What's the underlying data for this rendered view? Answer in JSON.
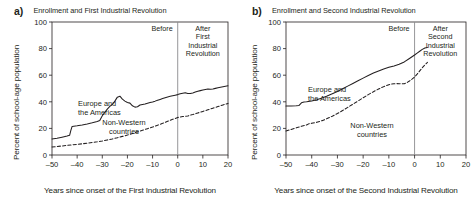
{
  "figure": {
    "background": "#ffffff",
    "ink_color": "#231f20",
    "divider_color": "#8b8b8d"
  },
  "panels": [
    {
      "letter": "a)",
      "title": "Enrollment and First Industrial Revolution",
      "before_label": "Before",
      "after_label": "After First Industrial Revolution",
      "after_label_lines": [
        "After",
        "First",
        "Industrial",
        "Revolution"
      ],
      "series_label_western": "Europe and the Americas",
      "series_label_western_lines": [
        "Europe and",
        "the Americas"
      ],
      "series_label_nonwestern": "Non-Western countries",
      "series_label_nonwestern_lines": [
        "Non-Western",
        "countries"
      ]
    },
    {
      "letter": "b)",
      "title": "Enrollment and Second Industrial Revolution",
      "before_label": "Before",
      "after_label": "After Second Industrial Revolution",
      "after_label_lines": [
        "After",
        "Second",
        "Industrial",
        "Revolution"
      ],
      "series_label_western": "Europe and the Americas",
      "series_label_western_lines": [
        "Europe and",
        "the Americas"
      ],
      "series_label_nonwestern": "Non-Western countries",
      "series_label_nonwestern_lines": [
        "Non-Western",
        "countries"
      ]
    }
  ],
  "chart_data": [
    {
      "type": "line",
      "panel": "a",
      "title": "Enrollment and First Industrial Revolution",
      "xlabel": "Years since onset of the First Industrial Revolution",
      "ylabel": "Percent of school-age population",
      "xlim": [
        -50,
        20
      ],
      "ylim": [
        0,
        100
      ],
      "xticks": [
        -50,
        -40,
        -30,
        -20,
        -10,
        0,
        10,
        20
      ],
      "xticklabels": [
        "–50",
        "–40",
        "–30",
        "–20",
        "–10",
        "0",
        "10",
        "20"
      ],
      "yticks": [
        0,
        20,
        40,
        60,
        80,
        100
      ],
      "yticklabels": [
        "0",
        "20",
        "40",
        "60",
        "80",
        "100"
      ],
      "grid": false,
      "legend": "inline-annotations",
      "vertical_reference_line": {
        "x": 0,
        "label_left": "Before",
        "label_right": "After First Industrial Revolution"
      },
      "series": [
        {
          "name": "Europe and the Americas",
          "style": "solid",
          "x": [
            -50,
            -48,
            -46,
            -44,
            -43,
            -42.5,
            -42,
            -40,
            -38,
            -36,
            -34,
            -32,
            -31,
            -30,
            -29,
            -28,
            -27,
            -26,
            -25,
            -24,
            -23,
            -22,
            -21,
            -20,
            -19,
            -18,
            -17,
            -16,
            -15,
            -14,
            -13,
            -12,
            -11,
            -10,
            -9,
            -8,
            -7,
            -6,
            -5,
            -4,
            -3,
            -2,
            -1,
            0,
            1,
            2,
            3,
            4,
            5,
            6,
            7,
            8,
            9,
            10,
            11,
            12,
            13,
            14,
            15,
            16,
            17,
            18,
            19,
            20
          ],
          "values": [
            12.0,
            12.6,
            13.4,
            14.2,
            14.8,
            18.5,
            21.5,
            22.0,
            22.6,
            23.3,
            24.2,
            25.2,
            26.0,
            29.5,
            32.0,
            34.5,
            36.5,
            38.0,
            40.5,
            43.5,
            44.2,
            42.0,
            40.5,
            39.5,
            39.0,
            37.0,
            36.0,
            36.3,
            37.6,
            38.0,
            38.3,
            38.9,
            39.4,
            39.9,
            40.5,
            41.2,
            41.8,
            42.4,
            43.0,
            43.6,
            44.1,
            44.6,
            45.0,
            45.4,
            46.0,
            46.5,
            46.8,
            46.3,
            46.2,
            46.6,
            47.3,
            47.9,
            48.4,
            48.9,
            49.3,
            49.6,
            49.4,
            49.6,
            50.1,
            50.5,
            50.9,
            51.3,
            51.7,
            52.0
          ]
        },
        {
          "name": "Non-Western countries",
          "style": "dashed",
          "x": [
            -50,
            -48,
            -46,
            -44,
            -42,
            -40,
            -38,
            -36,
            -34,
            -32,
            -30,
            -28,
            -26,
            -24,
            -22,
            -20,
            -18,
            -16,
            -14,
            -12,
            -10,
            -8,
            -6,
            -4,
            -2,
            0,
            1,
            2,
            3,
            4,
            6,
            8,
            10,
            12,
            14,
            16,
            18,
            20
          ],
          "values": [
            6.0,
            6.4,
            6.8,
            7.2,
            7.6,
            8.0,
            8.4,
            8.9,
            9.4,
            9.9,
            10.5,
            11.3,
            12.1,
            13.0,
            14.0,
            15.0,
            16.2,
            17.4,
            18.6,
            19.8,
            21.0,
            22.4,
            23.8,
            25.3,
            26.8,
            28.2,
            28.6,
            28.9,
            29.1,
            29.4,
            30.4,
            31.6,
            32.8,
            34.0,
            35.2,
            36.4,
            37.6,
            38.8
          ]
        }
      ]
    },
    {
      "type": "line",
      "panel": "b",
      "title": "Enrollment and Second Industrial Revolution",
      "xlabel": "Years since onset of the Second Industrial Revolution",
      "ylabel": "Percent of school-age population",
      "xlim": [
        -50,
        20
      ],
      "ylim": [
        0,
        100
      ],
      "xticks": [
        -50,
        -40,
        -30,
        -20,
        -10,
        0,
        10,
        20
      ],
      "xticklabels": [
        "–50",
        "–40",
        "–30",
        "–20",
        "–10",
        "0",
        "10",
        "20"
      ],
      "yticks": [
        0,
        20,
        40,
        60,
        80,
        100
      ],
      "yticklabels": [
        "0",
        "20",
        "40",
        "60",
        "80",
        "100"
      ],
      "grid": false,
      "legend": "inline-annotations",
      "vertical_reference_line": {
        "x": 0,
        "label_left": "Before",
        "label_right": "After Second Industrial Revolution"
      },
      "series": [
        {
          "name": "Europe and the Americas",
          "style": "solid",
          "x": [
            -50,
            -48,
            -46,
            -45,
            -44,
            -43,
            -42,
            -40,
            -38,
            -36,
            -34,
            -32,
            -30,
            -28,
            -26,
            -24,
            -22,
            -20,
            -18,
            -16,
            -14,
            -12,
            -10,
            -8,
            -6,
            -4,
            -2,
            0,
            1,
            2,
            3,
            4,
            5
          ],
          "values": [
            36.8,
            36.9,
            37.0,
            37.2,
            39.2,
            39.8,
            40.0,
            40.6,
            41.5,
            42.8,
            44.3,
            46.0,
            47.8,
            49.8,
            51.8,
            53.8,
            55.8,
            57.8,
            59.8,
            61.6,
            63.2,
            64.6,
            65.9,
            67.0,
            68.2,
            70.0,
            72.6,
            75.2,
            76.6,
            78.0,
            79.4,
            80.4,
            80.8
          ]
        },
        {
          "name": "Non-Western countries",
          "style": "dashed",
          "x": [
            -50,
            -48,
            -46,
            -44,
            -42,
            -41,
            -40,
            -38,
            -36,
            -34,
            -32,
            -30,
            -28,
            -26,
            -24,
            -22,
            -20,
            -18,
            -16,
            -14,
            -12,
            -10,
            -9,
            -8,
            -7,
            -6,
            -5,
            -4,
            -3,
            -2,
            -1,
            0,
            1,
            2,
            3,
            4,
            5
          ],
          "values": [
            18.0,
            19.2,
            20.4,
            21.6,
            22.6,
            23.6,
            23.8,
            24.6,
            25.8,
            27.4,
            29.2,
            31.2,
            33.4,
            35.8,
            38.2,
            40.6,
            43.0,
            45.4,
            47.6,
            49.6,
            51.4,
            52.8,
            53.3,
            53.6,
            53.7,
            53.6,
            53.5,
            53.6,
            54.4,
            55.6,
            57.0,
            58.6,
            60.8,
            63.2,
            65.6,
            67.8,
            69.6
          ]
        }
      ]
    }
  ]
}
